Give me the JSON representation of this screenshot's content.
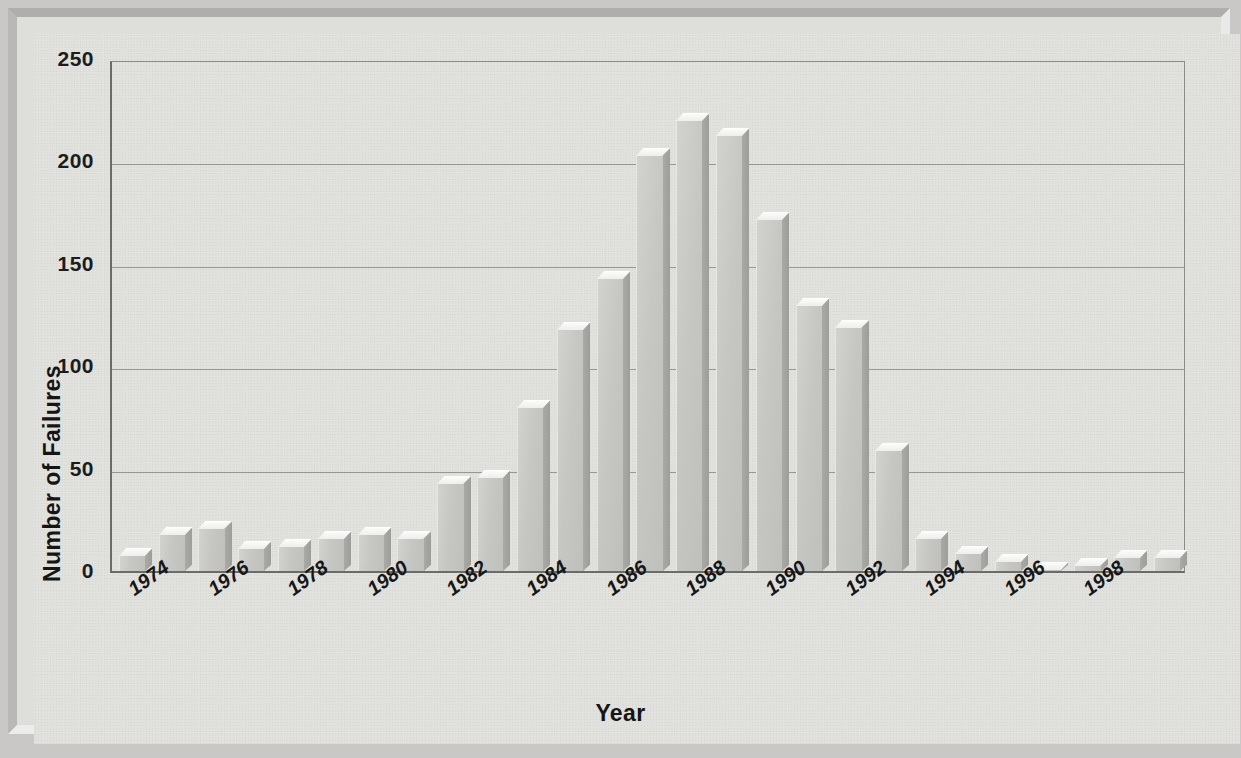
{
  "chart_data": {
    "type": "bar",
    "title": "",
    "xlabel": "Year",
    "ylabel": "Number of Failures",
    "ylim": [
      0,
      250
    ],
    "ytick_labels": [
      "250",
      "200",
      "150",
      "100",
      "50",
      "0"
    ],
    "ytick_values": [
      250,
      200,
      150,
      100,
      50,
      0
    ],
    "grid": "horizontal",
    "legend": "none",
    "xtick_labels": [
      "1974",
      "1976",
      "1978",
      "1980",
      "1982",
      "1984",
      "1986",
      "1988",
      "1990",
      "1992",
      "1994",
      "1996",
      "1998"
    ],
    "xtick_label_interval": 2,
    "categories": [
      "1974",
      "1975",
      "1976",
      "1977",
      "1978",
      "1979",
      "1980",
      "1981",
      "1982",
      "1983",
      "1984",
      "1985",
      "1986",
      "1987",
      "1988",
      "1989",
      "1990",
      "1991",
      "1992",
      "1993",
      "1994",
      "1995",
      "1996",
      "1997",
      "1998",
      "1999",
      "2000"
    ],
    "values": [
      8,
      18,
      21,
      11,
      12,
      16,
      18,
      16,
      43,
      46,
      80,
      118,
      143,
      203,
      220,
      213,
      172,
      130,
      119,
      59,
      16,
      9,
      5,
      1,
      3,
      7,
      7
    ],
    "series": [
      {
        "name": "Number of Failures",
        "values": [
          8,
          18,
          21,
          11,
          12,
          16,
          18,
          16,
          43,
          46,
          80,
          118,
          143,
          203,
          220,
          213,
          172,
          130,
          119,
          59,
          16,
          9,
          5,
          1,
          3,
          7,
          7
        ]
      }
    ],
    "colors": {
      "bar_face": "#c6c6c3",
      "bar_top": "#f7f7f5",
      "bar_side": "#a2a29f",
      "background": "#e3e3e0",
      "frame": "#b8b8b6",
      "gridline": "#97979a",
      "axis": "#6b6b69",
      "text": "#161616"
    }
  }
}
